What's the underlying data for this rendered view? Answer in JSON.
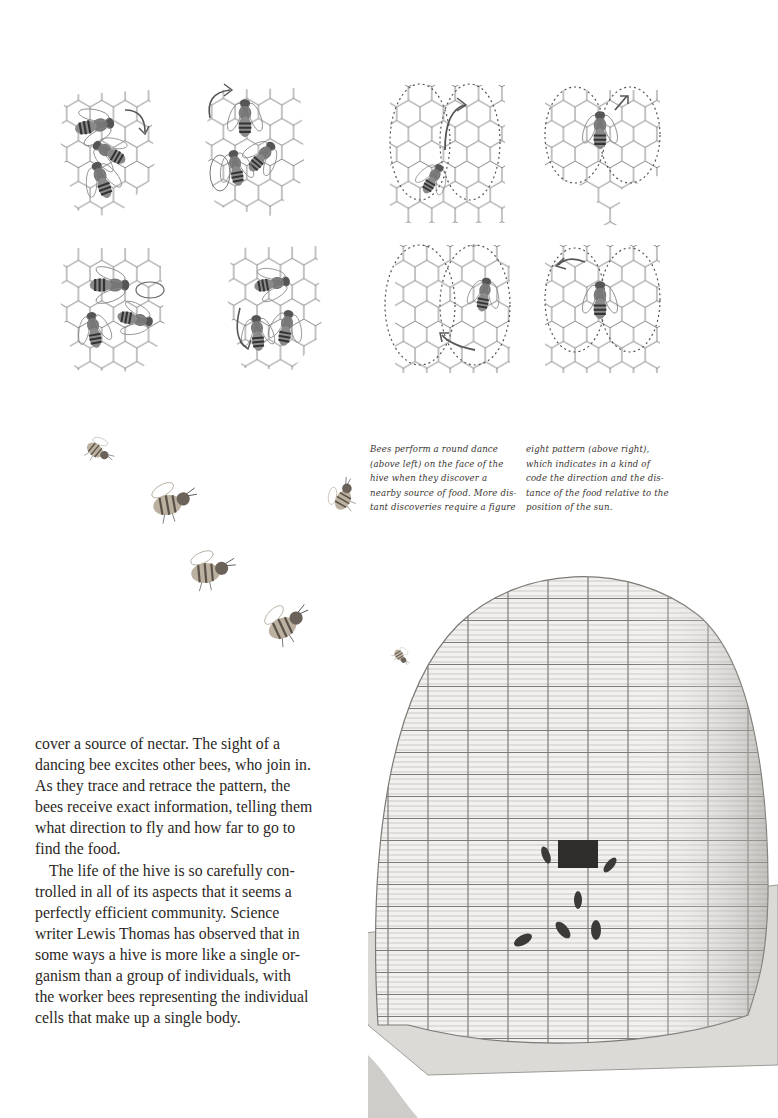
{
  "page": {
    "illustrations": {
      "round_dance_panels": [
        {
          "label": "round-dance-top-1"
        },
        {
          "label": "round-dance-top-2"
        },
        {
          "label": "round-dance-bottom-1"
        },
        {
          "label": "round-dance-bottom-2"
        }
      ],
      "figure_eight_panels": [
        {
          "label": "figure-eight-top-1"
        },
        {
          "label": "figure-eight-top-2"
        },
        {
          "label": "figure-eight-bottom-1"
        },
        {
          "label": "figure-eight-bottom-2"
        }
      ],
      "flying_bees_count": 7,
      "hive": "skep-beehive-drawing"
    },
    "caption": {
      "col1": [
        "Bees perform a round dance",
        "(above left) on the face of the",
        "hive when they discover a",
        "nearby source of food. More dis-",
        "tant discoveries require a figure"
      ],
      "col2": [
        "eight pattern (above right),",
        "which indicates in a kind of",
        "code the direction and the dis-",
        "tance of the food relative to the",
        "position of the sun."
      ]
    },
    "body": {
      "para1": [
        "cover a source of nectar. The sight of a",
        "dancing bee excites other bees, who join in.",
        "As they trace and retrace the pattern, the",
        "bees receive exact information, telling them",
        "what direction to fly and how far to go to",
        "find the food."
      ],
      "para2": [
        "The life of the hive is so carefully con-",
        "trolled in all of its aspects that it seems a",
        "perfectly efficient community. Science",
        "writer Lewis Thomas has observed that in",
        "some ways a hive is more like a single or-",
        "ganism than a group of individuals, with",
        "the worker bees representing the individual",
        "cells that make up a single body."
      ]
    }
  }
}
